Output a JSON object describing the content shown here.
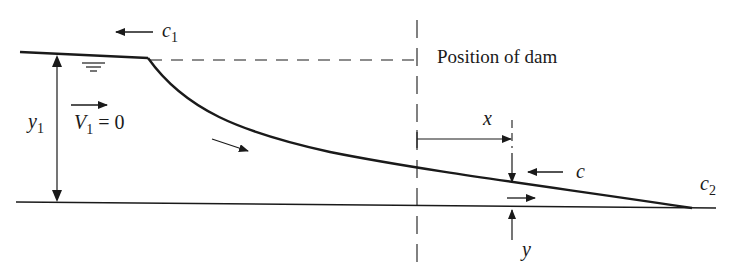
{
  "diagram": {
    "labels": {
      "c1": "c",
      "c1_sub": "1",
      "position_of_dam": "Position of dam",
      "y1": "y",
      "y1_sub": "1",
      "v1": "V",
      "v1_sub": "1",
      "v1_eq": " = 0",
      "x": "x",
      "c": "c",
      "c2": "c",
      "c2_sub": "2",
      "y": "y"
    },
    "colors": {
      "stroke": "#1a1a1a",
      "background": "#ffffff"
    }
  }
}
